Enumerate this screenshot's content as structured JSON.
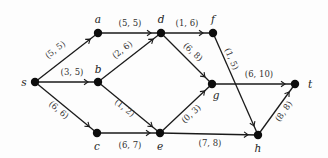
{
  "diagram": {
    "colors": {
      "edge": "#1a1a1a",
      "node": "#0d0d0d",
      "label": "#333333",
      "background": "#fdfdfd"
    },
    "nodes": [
      {
        "id": "s",
        "label": "s",
        "x": 35,
        "y": 82,
        "lx": 24,
        "ly": 86,
        "anchor": "middle"
      },
      {
        "id": "a",
        "label": "a",
        "x": 98,
        "y": 33,
        "lx": 98,
        "ly": 23,
        "anchor": "middle"
      },
      {
        "id": "b",
        "label": "b",
        "x": 98,
        "y": 82,
        "lx": 98,
        "ly": 73,
        "anchor": "middle"
      },
      {
        "id": "c",
        "label": "c",
        "x": 97,
        "y": 133,
        "lx": 97,
        "ly": 150,
        "anchor": "middle"
      },
      {
        "id": "d",
        "label": "d",
        "x": 161,
        "y": 33,
        "lx": 161,
        "ly": 23,
        "anchor": "middle"
      },
      {
        "id": "e",
        "label": "e",
        "x": 160,
        "y": 133,
        "lx": 160,
        "ly": 150,
        "anchor": "middle"
      },
      {
        "id": "f",
        "label": "f",
        "x": 213,
        "y": 33,
        "lx": 213,
        "ly": 23,
        "anchor": "middle"
      },
      {
        "id": "g",
        "label": "g",
        "x": 212,
        "y": 84,
        "lx": 216,
        "ly": 99,
        "anchor": "middle"
      },
      {
        "id": "h",
        "label": "h",
        "x": 258,
        "y": 135,
        "lx": 258,
        "ly": 152,
        "anchor": "middle"
      },
      {
        "id": "t",
        "label": "t",
        "x": 295,
        "y": 84,
        "lx": 310,
        "ly": 88,
        "anchor": "middle"
      }
    ],
    "edges": [
      {
        "from": "s",
        "to": "a",
        "label": "(5, 5)",
        "lx": 57,
        "ly": 52,
        "rot": -38
      },
      {
        "from": "s",
        "to": "b",
        "label": "(3, 5)",
        "lx": 72,
        "ly": 75,
        "rot": 0
      },
      {
        "from": "s",
        "to": "c",
        "label": "(6, 6)",
        "lx": 57,
        "ly": 112,
        "rot": 40
      },
      {
        "from": "a",
        "to": "d",
        "label": "(5, 5)",
        "lx": 130,
        "ly": 26,
        "rot": 0
      },
      {
        "from": "b",
        "to": "d",
        "label": "(2, 6)",
        "lx": 124,
        "ly": 52,
        "rot": -38
      },
      {
        "from": "b",
        "to": "e",
        "label": "(1, 2)",
        "lx": 123,
        "ly": 110,
        "rot": 38
      },
      {
        "from": "c",
        "to": "e",
        "label": "(6, 7)",
        "lx": 130,
        "ly": 148,
        "rot": 0
      },
      {
        "from": "d",
        "to": "f",
        "label": "(1, 6)",
        "lx": 187,
        "ly": 26,
        "rot": 0
      },
      {
        "from": "d",
        "to": "g",
        "label": "(6, 8)",
        "lx": 191,
        "ly": 54,
        "rot": 43
      },
      {
        "from": "f",
        "to": "h",
        "label": "(1, 5)",
        "lx": 229,
        "ly": 60,
        "rot": 67
      },
      {
        "from": "e",
        "to": "g",
        "label": "(0, 3)",
        "lx": 193,
        "ly": 116,
        "rot": -43
      },
      {
        "from": "e",
        "to": "h",
        "label": "(7, 8)",
        "lx": 210,
        "ly": 146,
        "rot": 0
      },
      {
        "from": "g",
        "to": "t",
        "label": "(6, 10)",
        "lx": 259,
        "ly": 77,
        "rot": 0
      },
      {
        "from": "h",
        "to": "t",
        "label": "(8, 8)",
        "lx": 286,
        "ly": 113,
        "rot": -55
      }
    ]
  }
}
